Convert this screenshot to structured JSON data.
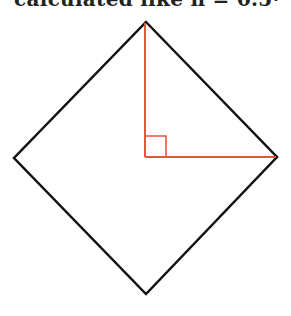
{
  "header": {
    "text": "calculated like n = 0.5·"
  },
  "diagram": {
    "square_vertices": {
      "top": [
        146,
        22
      ],
      "right": [
        277,
        157
      ],
      "bottom": [
        146,
        294
      ],
      "left": [
        14,
        158
      ]
    },
    "center": [
      145,
      157
    ],
    "right_angle_size": 21,
    "colors": {
      "outline": "#111111",
      "radius": "#e8533f"
    }
  }
}
